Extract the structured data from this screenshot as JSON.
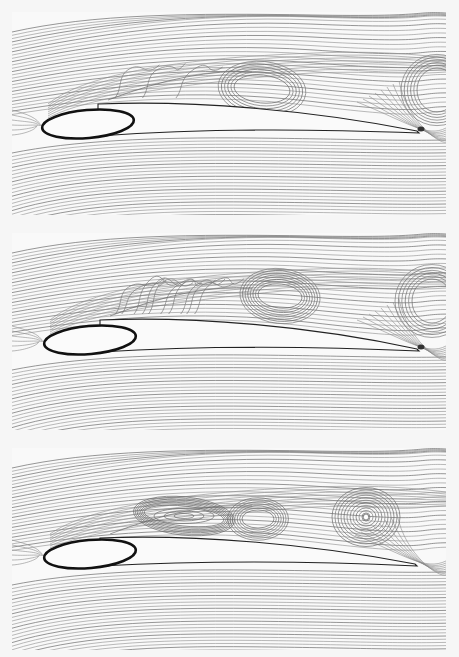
{
  "figure": {
    "panel_count": 3,
    "colors": {
      "background": "#f6f6f6",
      "streamline": "#8a8a8a",
      "airfoil_outline": "#222222",
      "leading_edge_outline": "#111111"
    }
  },
  "panels": [
    {
      "id": "top",
      "top": 12,
      "height": 203,
      "airfoil": {
        "nose_cx": 76,
        "nose_cy": 112,
        "nose_rx": 46,
        "nose_ry": 14,
        "nose_rot": -5,
        "upper_lead_y": 90,
        "te_x": 405,
        "te_y": 120,
        "lower_y": 121
      },
      "te_dot": true,
      "vortices": [
        {
          "cx": 250,
          "cy": 77,
          "rx": 28,
          "ry": 14,
          "rings": 6,
          "spacing": 3.2,
          "core_open": true
        },
        {
          "cx": 425,
          "cy": 78,
          "rx": 20,
          "ry": 22,
          "rings": 6,
          "spacing": 3.2,
          "core_open": true
        }
      ],
      "separation_wiggles": 3
    },
    {
      "id": "middle",
      "top": 233,
      "height": 197,
      "airfoil": {
        "nose_cx": 78,
        "nose_cy": 107,
        "nose_rx": 46,
        "nose_ry": 14,
        "nose_rot": -5,
        "upper_lead_y": 85,
        "te_x": 405,
        "te_y": 117,
        "lower_y": 117
      },
      "te_dot": true,
      "vortices": [
        {
          "cx": 268,
          "cy": 63,
          "rx": 22,
          "ry": 12,
          "rings": 8,
          "spacing": 2.6,
          "core_open": true
        },
        {
          "cx": 420,
          "cy": 68,
          "rx": 20,
          "ry": 22,
          "rings": 6,
          "spacing": 3.4,
          "core_open": true
        }
      ],
      "separation_wiggles": 10
    },
    {
      "id": "bottom",
      "top": 448,
      "height": 202,
      "airfoil": {
        "nose_cx": 78,
        "nose_cy": 106,
        "nose_rx": 46,
        "nose_ry": 14,
        "nose_rot": -5,
        "upper_lead_y": 88,
        "te_x": 403,
        "te_y": 117,
        "lower_y": 117
      },
      "te_dot": false,
      "vortices": [
        {
          "cx": 172,
          "cy": 68,
          "rx": 40,
          "ry": 10,
          "rings": 7,
          "spacing": 1.8,
          "core_open": false
        },
        {
          "cx": 246,
          "cy": 71,
          "rx": 16,
          "ry": 9,
          "rings": 7,
          "spacing": 2.4,
          "core_open": true
        },
        {
          "cx": 354,
          "cy": 69,
          "rx": 4,
          "ry": 4,
          "rings": 11,
          "spacing": 3.0,
          "core_open": false,
          "core_dot": true
        }
      ],
      "separation_wiggles": 0
    }
  ]
}
